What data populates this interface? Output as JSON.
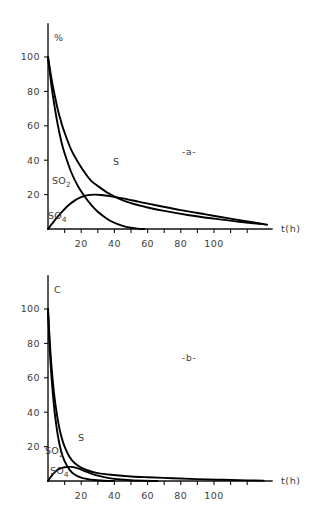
{
  "figure": {
    "panels": [
      {
        "id": "panel-a",
        "annotation": "-a-",
        "ylabel": "%",
        "xlabel": "t(h)",
        "curve_labels": {
          "s": "S",
          "so2_main": "SO",
          "so2_sub": "2",
          "so4_main": "SO",
          "so4_sub": "4"
        }
      },
      {
        "id": "panel-b",
        "annotation": "-b-",
        "ylabel": "C",
        "xlabel": "t(h)",
        "curve_labels": {
          "s": "S",
          "so2_main": "SO",
          "so2_sub": "2",
          "so4_main": "SO",
          "so4_sub": "4"
        }
      }
    ],
    "axis_colors": {
      "line": "#111111",
      "curve": "#000000",
      "text": "#3c3c3c"
    }
  },
  "chart_data": [
    {
      "type": "line",
      "title": "-a-",
      "xlabel": "t(h)",
      "ylabel": "%",
      "xlim": [
        0,
        130
      ],
      "ylim": [
        0,
        112
      ],
      "xticks": [
        20,
        40,
        60,
        80,
        100
      ],
      "xtick_labels": [
        "20",
        "40",
        "60",
        "80",
        "100"
      ],
      "yticks": [
        20,
        40,
        60,
        80,
        100
      ],
      "ytick_labels": [
        "20",
        "40",
        "60",
        "80",
        "100"
      ],
      "grid": false,
      "legend": "inline-labels",
      "series": [
        {
          "name": "S",
          "x": [
            0,
            2,
            4,
            6,
            8,
            10,
            14,
            18,
            22,
            26,
            30,
            36,
            42,
            50,
            60,
            70,
            85,
            100,
            115,
            128
          ],
          "y": [
            100,
            88,
            78,
            69,
            62,
            56,
            46,
            39,
            33,
            28,
            25,
            21,
            18,
            15,
            12.5,
            10.5,
            8,
            6,
            4.2,
            3
          ]
        },
        {
          "name": "SO2",
          "x": [
            0,
            2,
            4,
            6,
            8,
            10,
            14,
            18,
            22,
            26,
            30,
            34,
            38,
            42,
            46,
            50,
            54,
            58
          ],
          "y": [
            100,
            84,
            71,
            60,
            51,
            44,
            33,
            25,
            19,
            14,
            10,
            7,
            4.5,
            2.8,
            1.5,
            0.7,
            0.2,
            0
          ]
        },
        {
          "name": "SO4",
          "x": [
            0,
            4,
            8,
            12,
            16,
            20,
            24,
            28,
            32,
            38,
            45,
            55,
            65,
            80,
            95,
            110,
            125,
            132
          ],
          "y": [
            0,
            5,
            9.5,
            13.5,
            16.5,
            18.5,
            19.7,
            20,
            19.8,
            19,
            17.8,
            15.8,
            13.8,
            11,
            8.5,
            6,
            3.6,
            2.5
          ]
        }
      ]
    },
    {
      "type": "line",
      "title": "-b-",
      "xlabel": "t(h)",
      "ylabel": "C",
      "xlim": [
        0,
        130
      ],
      "ylim": [
        0,
        112
      ],
      "xticks": [
        20,
        40,
        60,
        80,
        100
      ],
      "xtick_labels": [
        "20",
        "40",
        "60",
        "80",
        "100"
      ],
      "yticks": [
        20,
        40,
        60,
        80,
        100
      ],
      "ytick_labels": [
        "20",
        "40",
        "60",
        "80",
        "100"
      ],
      "grid": false,
      "legend": "inline-labels",
      "series": [
        {
          "name": "S",
          "x": [
            0,
            1,
            2,
            3,
            4,
            6,
            8,
            10,
            13,
            16,
            20,
            25,
            30,
            38,
            48,
            60,
            75,
            90,
            105,
            120,
            130
          ],
          "y": [
            100,
            82,
            68,
            57,
            48,
            35,
            26,
            20,
            14,
            10.5,
            7.8,
            5.8,
            4.6,
            3.6,
            2.8,
            2.2,
            1.6,
            1.1,
            0.7,
            0.35,
            0.2
          ]
        },
        {
          "name": "SO2",
          "x": [
            0,
            1,
            2,
            3,
            4,
            6,
            8,
            10,
            13,
            16,
            20,
            24,
            28,
            32,
            36,
            40
          ],
          "y": [
            100,
            78,
            62,
            50,
            40,
            26,
            17,
            11.5,
            6.5,
            3.8,
            2,
            1.1,
            0.6,
            0.3,
            0.1,
            0
          ]
        },
        {
          "name": "SO4",
          "x": [
            0,
            2,
            4,
            6,
            8,
            10,
            12,
            14,
            16,
            19,
            22,
            26,
            30,
            36,
            42,
            50,
            58,
            66
          ],
          "y": [
            0,
            2.8,
            5,
            6.6,
            7.5,
            8,
            8.2,
            8.2,
            7.9,
            7,
            5.8,
            4.3,
            3.1,
            1.8,
            1,
            0.4,
            0.12,
            0
          ]
        }
      ]
    }
  ]
}
